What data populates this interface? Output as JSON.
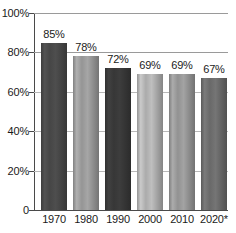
{
  "chart_data": {
    "type": "bar",
    "title": "",
    "xlabel": "",
    "ylabel": "",
    "ylim": [
      0,
      100
    ],
    "grid": true,
    "legend": "none",
    "categories": [
      "1970",
      "1980",
      "1990",
      "2000",
      "2010",
      "2020*"
    ],
    "values": [
      85,
      78,
      72,
      69,
      69,
      67
    ],
    "value_labels": [
      "85%",
      "78%",
      "72%",
      "69%",
      "69%",
      "67%"
    ],
    "y_ticks": [
      {
        "value": 100,
        "label": "100%"
      },
      {
        "value": 80,
        "label": "80%"
      },
      {
        "value": 60,
        "label": "60%"
      },
      {
        "value": 40,
        "label": "40%"
      },
      {
        "value": 20,
        "label": "20%"
      },
      {
        "value": 0,
        "label": "0"
      }
    ],
    "bar_colors": [
      "#4a4a4a",
      "#9d9d9d",
      "#3a3a3a",
      "#b4b4b4",
      "#9a9a9a",
      "#6e6e6e"
    ],
    "footnote_marker": "*"
  },
  "colors": {
    "background": "#ffffff",
    "axis": "#4a4a4a",
    "gridline": "#9a9a9a",
    "text": "#1a1a1a"
  }
}
